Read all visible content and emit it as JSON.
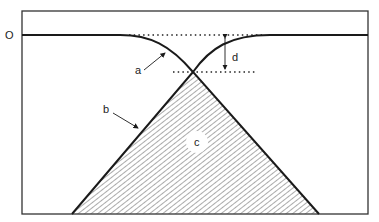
{
  "diagram": {
    "type": "schematic",
    "axis_label_zero": "O",
    "labels": {
      "a": "a",
      "b": "b",
      "c": "c",
      "d": "d"
    },
    "annotations": [
      {
        "id": "a",
        "description": "arrow pointing to descending curve"
      },
      {
        "id": "b",
        "description": "arrow pointing to left edge of hatched triangle"
      },
      {
        "id": "c",
        "description": "hatched triangular region"
      },
      {
        "id": "d",
        "description": "double-headed vertical arrow between two dotted levels"
      }
    ],
    "colors": {
      "line": "#1a1a1a",
      "frame": "#333333",
      "hatch": "#444444",
      "background": "#ffffff"
    }
  }
}
